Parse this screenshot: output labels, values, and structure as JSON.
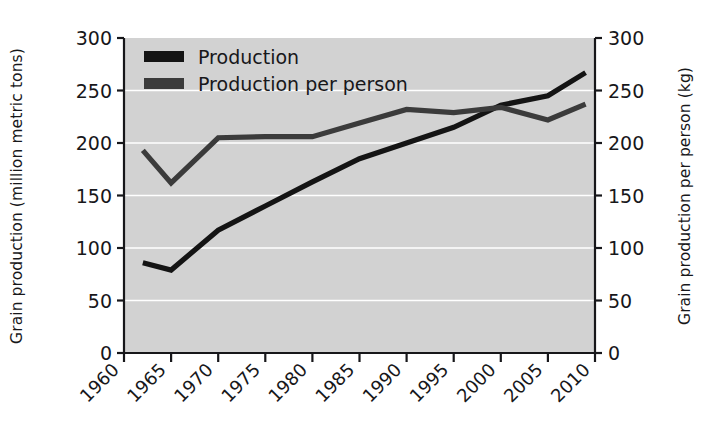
{
  "chart_data": {
    "type": "line",
    "title": "",
    "xlabel": "",
    "ylabel": "Grain production (million metric tons)",
    "ylabel_right": "Grain production per person (kg)",
    "grid": true,
    "grid_color": "#ffffff",
    "plot_background": "#d2d2d2",
    "legend_position": "top-left",
    "xlim": [
      1960,
      2010
    ],
    "ylim": [
      0,
      300
    ],
    "ylim_right": [
      0,
      300
    ],
    "xticks": [
      "1960",
      "1965",
      "1970",
      "1975",
      "1980",
      "1985",
      "1990",
      "1995",
      "2000",
      "2005",
      "2010"
    ],
    "xtick_values": [
      1960,
      1965,
      1970,
      1975,
      1980,
      1985,
      1990,
      1995,
      2000,
      2005,
      2010
    ],
    "yticks": [
      "0",
      "50",
      "100",
      "150",
      "200",
      "250",
      "300"
    ],
    "ytick_values": [
      0,
      50,
      100,
      150,
      200,
      250,
      300
    ],
    "yticks_right": [
      "0",
      "50",
      "100",
      "150",
      "200",
      "250",
      "300"
    ],
    "ytick_values_right": [
      0,
      50,
      100,
      150,
      200,
      250,
      300
    ],
    "x": [
      1962,
      1965,
      1970,
      1975,
      1980,
      1985,
      1990,
      1995,
      2000,
      2005,
      2009
    ],
    "series": [
      {
        "name": "Production",
        "axis": "left",
        "color": "#141414",
        "units": "million metric tons",
        "values": [
          86,
          79,
          117,
          140,
          163,
          185,
          200,
          215,
          236,
          245,
          267
        ]
      },
      {
        "name": "Production per person",
        "axis": "right",
        "color": "#3b3b3b",
        "units": "kg",
        "values": [
          193,
          162,
          205,
          206,
          206,
          219,
          232,
          229,
          234,
          222,
          237
        ]
      }
    ],
    "legend": [
      {
        "label": "Production",
        "color": "#141414"
      },
      {
        "label": "Production per person",
        "color": "#3b3b3b"
      }
    ]
  },
  "axes": {
    "left_title": "Grain production (million metric tons)",
    "right_title": "Grain production per person (kg)"
  }
}
